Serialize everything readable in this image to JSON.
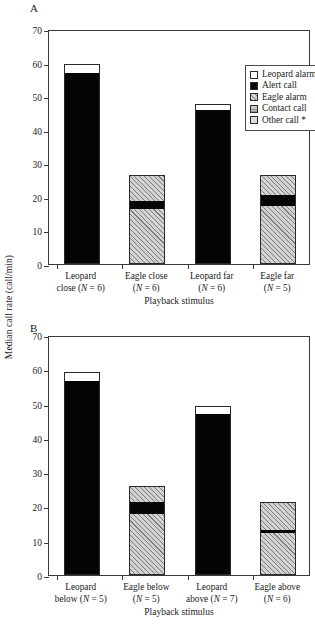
{
  "figure": {
    "ylabel": "Median call rate (call/min)",
    "xlabel": "Playback stimulus",
    "panel_a_letter": "A",
    "panel_b_letter": "B"
  },
  "legend": {
    "title": "",
    "items": [
      {
        "label": "Leopard alarm",
        "key": "leopard_alarm",
        "color": "#ffffff"
      },
      {
        "label": "Alert call",
        "key": "alert_call",
        "color": "#050505"
      },
      {
        "label": "Eagle alarm",
        "key": "eagle_alarm",
        "color": "#d2d2d2"
      },
      {
        "label": "Contact call",
        "key": "contact_call",
        "color": "#c9c9c9"
      },
      {
        "label": "Other call *",
        "key": "other_call",
        "color": "#dcdcdc"
      }
    ]
  },
  "axis": {
    "yticks": [
      0,
      10,
      20,
      30,
      40,
      50,
      60,
      70
    ],
    "ytick_labels": [
      "0",
      "10",
      "20",
      "30",
      "40",
      "50",
      "60",
      "70"
    ],
    "ymin": 0,
    "ymax": 70
  },
  "chart_data": [
    {
      "type": "bar",
      "stacked": true,
      "panel": "A",
      "title": "A",
      "xlabel": "Playback stimulus",
      "ylabel": "Median call rate (call/min)",
      "ylim": [
        0,
        70
      ],
      "ytick_step": 10,
      "grid": false,
      "legend_position": "top-right",
      "categories": [
        "Leopard close (N = 6)",
        "Eagle close (N = 6)",
        "Leopard far (N = 6)",
        "Eagle far (N = 5)"
      ],
      "category_lines": [
        [
          "Leopard",
          "close (N = 6)"
        ],
        [
          "Eagle close",
          "(N = 6)"
        ],
        [
          "Leopard far",
          "(N = 6)"
        ],
        [
          "Eagle far",
          "(N = 5)"
        ]
      ],
      "n_values": [
        6,
        6,
        6,
        5
      ],
      "series": [
        {
          "name": "Eagle alarm (lower)",
          "key": "eagle_alarm",
          "values": [
            0,
            16.5,
            0,
            17.3
          ]
        },
        {
          "name": "Alert call",
          "key": "alert_call",
          "values": [
            57.0,
            2.2,
            46.0,
            3.3
          ]
        },
        {
          "name": "Eagle alarm (upper)",
          "key": "eagle_alarm",
          "values": [
            0,
            7.7,
            0,
            5.8
          ]
        },
        {
          "name": "Leopard alarm",
          "key": "leopard_alarm",
          "values": [
            2.5,
            0,
            1.8,
            0
          ]
        }
      ],
      "totals": [
        59.5,
        26.4,
        47.8,
        26.4
      ]
    },
    {
      "type": "bar",
      "stacked": true,
      "panel": "B",
      "title": "B",
      "xlabel": "Playback stimulus",
      "ylabel": "Median call rate (call/min)",
      "ylim": [
        0,
        70
      ],
      "ytick_step": 10,
      "grid": false,
      "legend_position": "none",
      "categories": [
        "Leopard below (N = 5)",
        "Eagle below (N = 5)",
        "Leopard above (N = 7)",
        "Eagle above (N = 6)"
      ],
      "category_lines": [
        [
          "Leopard",
          "below (N = 5)"
        ],
        [
          "Eagle below",
          "(N = 5)"
        ],
        [
          "Leopard",
          "above (N = 7)"
        ],
        [
          "Eagle above",
          "(N = 6)"
        ]
      ],
      "n_values": [
        5,
        5,
        7,
        6
      ],
      "series": [
        {
          "name": "Eagle alarm (lower)",
          "key": "eagle_alarm",
          "values": [
            0,
            17.8,
            0,
            12.2
          ]
        },
        {
          "name": "Alert call",
          "key": "alert_call",
          "values": [
            56.5,
            3.4,
            47.0,
            0.9
          ]
        },
        {
          "name": "Eagle alarm (upper)",
          "key": "eagle_alarm",
          "values": [
            0,
            4.8,
            0,
            8.1
          ]
        },
        {
          "name": "Leopard alarm",
          "key": "leopard_alarm",
          "values": [
            2.7,
            0,
            2.3,
            0
          ]
        }
      ],
      "totals": [
        59.2,
        26.0,
        49.3,
        21.2
      ]
    }
  ]
}
